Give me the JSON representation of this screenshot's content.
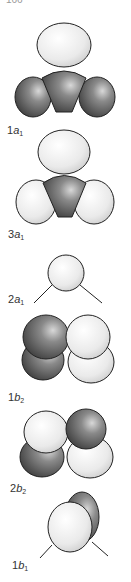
{
  "page_number": "166",
  "colors": {
    "light_lobe": "#efefef",
    "dark_lobe": "#5a5a5a",
    "outline": "#222222"
  },
  "orbitals": [
    {
      "id": "1a1",
      "label_num": "1",
      "label_sym": "a",
      "label_sub": "1"
    },
    {
      "id": "3a1",
      "label_num": "3",
      "label_sym": "a",
      "label_sub": "1"
    },
    {
      "id": "2a1",
      "label_num": "2",
      "label_sym": "a",
      "label_sub": "1"
    },
    {
      "id": "1b2",
      "label_num": "1",
      "label_sym": "b",
      "label_sub": "2"
    },
    {
      "id": "2b2",
      "label_num": "2",
      "label_sym": "b",
      "label_sub": "2"
    },
    {
      "id": "1b1",
      "label_num": "1",
      "label_sym": "b",
      "label_sub": "1"
    }
  ]
}
